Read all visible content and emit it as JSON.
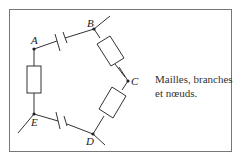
{
  "diagram": {
    "nodes": [
      {
        "id": "A",
        "label": "A",
        "x": 34,
        "y": 49
      },
      {
        "id": "B",
        "label": "B",
        "x": 94,
        "y": 29
      },
      {
        "id": "C",
        "label": "C",
        "x": 128,
        "y": 81
      },
      {
        "id": "D",
        "label": "D",
        "x": 93,
        "y": 134
      },
      {
        "id": "E",
        "label": "E",
        "x": 34,
        "y": 114
      }
    ],
    "branches": [
      {
        "from": "A",
        "to": "B",
        "component": "capacitor"
      },
      {
        "from": "B",
        "to": "C",
        "component": "resistor"
      },
      {
        "from": "C",
        "to": "D",
        "component": "resistor"
      },
      {
        "from": "D",
        "to": "E",
        "component": "capacitor"
      },
      {
        "from": "E",
        "to": "A",
        "component": "resistor"
      }
    ],
    "caption_line1": "Mailles, branches",
    "caption_line2": "et nœuds."
  }
}
